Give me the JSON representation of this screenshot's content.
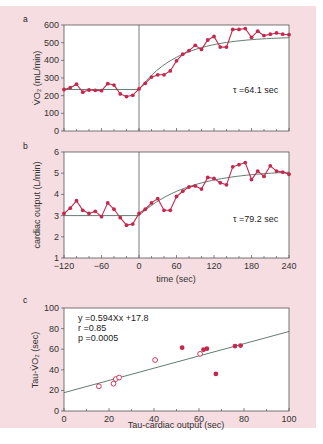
{
  "chart_data": [
    {
      "panel": "a",
      "type": "line",
      "ylabel": "V̇O₂ (mL/min)",
      "xlabel": "",
      "xlim": [
        -120,
        240
      ],
      "ylim": [
        0,
        600
      ],
      "yticks": [
        0,
        100,
        200,
        300,
        400,
        500,
        600
      ],
      "annotation": "τ =64.1 sec",
      "tau": 64.1,
      "baseline": 235,
      "asymptote": 535,
      "x": [
        -120,
        -110,
        -100,
        -90,
        -80,
        -70,
        -60,
        -50,
        -40,
        -30,
        -20,
        -10,
        0,
        10,
        20,
        30,
        40,
        50,
        60,
        70,
        80,
        90,
        100,
        110,
        120,
        130,
        140,
        150,
        160,
        170,
        180,
        190,
        200,
        210,
        220,
        230,
        240
      ],
      "values": [
        235,
        245,
        265,
        220,
        232,
        230,
        228,
        268,
        260,
        210,
        195,
        202,
        238,
        270,
        305,
        318,
        318,
        340,
        397,
        435,
        455,
        485,
        462,
        515,
        535,
        475,
        475,
        575,
        575,
        580,
        530,
        565,
        540,
        548,
        555,
        548,
        545
      ]
    },
    {
      "panel": "b",
      "type": "line",
      "ylabel": "cardiac output (L/min)",
      "xlabel": "time (sec)",
      "xlim": [
        -120,
        240
      ],
      "ylim": [
        1,
        6
      ],
      "xticks": [
        -120,
        -60,
        0,
        60,
        120,
        180,
        240
      ],
      "xtick_labels": [
        "−120",
        "−60",
        "0",
        "60",
        "120",
        "180",
        "240"
      ],
      "yticks": [
        1,
        2,
        3,
        4,
        5,
        6
      ],
      "annotation": "τ =79.2 sec",
      "tau": 79.2,
      "baseline": 3.0,
      "asymptote": 5.15,
      "x": [
        -120,
        -110,
        -100,
        -90,
        -80,
        -70,
        -60,
        -50,
        -40,
        -30,
        -20,
        -10,
        0,
        10,
        20,
        30,
        40,
        50,
        60,
        70,
        80,
        90,
        100,
        110,
        120,
        130,
        140,
        150,
        160,
        170,
        180,
        190,
        200,
        210,
        220,
        230,
        240
      ],
      "values": [
        3.1,
        3.35,
        3.7,
        3.25,
        3.1,
        3.2,
        2.95,
        3.6,
        3.3,
        2.9,
        2.55,
        2.6,
        3.1,
        3.3,
        3.6,
        3.8,
        3.25,
        3.25,
        3.9,
        4.15,
        4.35,
        4.4,
        4.25,
        4.8,
        4.75,
        4.55,
        4.45,
        5.3,
        5.4,
        5.5,
        4.7,
        5.1,
        4.85,
        5.35,
        5.1,
        5.05,
        4.95
      ]
    },
    {
      "panel": "c",
      "type": "scatter",
      "xlabel": "Tau-cardiac output (sec)",
      "ylabel": "Tau-V̇O₂ (sec)",
      "xlim": [
        0,
        100
      ],
      "ylim": [
        0,
        100
      ],
      "xticks": [
        0,
        20,
        40,
        60,
        80,
        100
      ],
      "yticks": [
        0,
        20,
        40,
        60,
        80,
        100
      ],
      "annotations": [
        "y =0.594Xx +17.8",
        "r =0.85",
        "p =0.0005"
      ],
      "regression": {
        "slope": 0.594,
        "intercept": 17.8,
        "r": 0.85,
        "p": 0.0005
      },
      "series": [
        {
          "name": "open",
          "marker": "open-circle",
          "points": [
            [
              15.5,
              24
            ],
            [
              22,
              26.5
            ],
            [
              23,
              31
            ],
            [
              24.5,
              32.5
            ],
            [
              40.5,
              49.5
            ],
            [
              60.5,
              55.5
            ]
          ]
        },
        {
          "name": "filled",
          "marker": "filled-circle",
          "points": [
            [
              52.5,
              61.5
            ],
            [
              62,
              59.5
            ],
            [
              63.5,
              60.5
            ],
            [
              67.5,
              36
            ],
            [
              76,
              63
            ],
            [
              78.5,
              63.5
            ]
          ]
        }
      ]
    }
  ],
  "panels": {
    "a": {
      "label": "a",
      "tau_text": "τ =64.1 sec",
      "ylabel": "V̇O₂ (mL/min)",
      "yticks": [
        "0",
        "100",
        "200",
        "300",
        "400",
        "500",
        "600"
      ]
    },
    "b": {
      "label": "b",
      "tau_text": "τ =79.2 sec",
      "ylabel": "cardiac output (L/min)",
      "xlabel": "time (sec)",
      "yticks": [
        "1",
        "2",
        "3",
        "4",
        "5",
        "6"
      ],
      "xticks": [
        "−120",
        "−60",
        "0",
        "60",
        "120",
        "180",
        "240"
      ]
    },
    "c": {
      "label": "c",
      "eq": "y =0.594Xx +17.8",
      "r": "r =0.85",
      "p": "p =0.0005",
      "ylabel": "Tau-V̇O₂ (sec)",
      "xlabel": "Tau-cardiac output (sec)",
      "yticks": [
        "0",
        "20",
        "40",
        "60",
        "80",
        "100"
      ],
      "xticks": [
        "0",
        "20",
        "40",
        "60",
        "80",
        "100"
      ]
    }
  },
  "colors": {
    "background": "#f6dde1",
    "series": "#c4284f",
    "fit": "#3a5a4a"
  }
}
